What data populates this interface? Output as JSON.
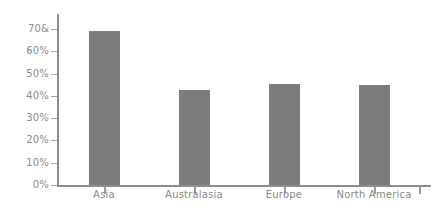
{
  "chart_data": {
    "type": "bar",
    "title": "",
    "subtitle": "",
    "xlabel": "",
    "ylabel": "",
    "categories": [
      "Asia",
      "Australasia",
      "Europe",
      "North America"
    ],
    "values": [
      69,
      42.5,
      45.5,
      45
    ],
    "ylim": [
      0,
      70
    ],
    "y_ticks": [
      0,
      10,
      20,
      30,
      40,
      50,
      60,
      70
    ],
    "y_tick_labels": [
      "0%",
      "10%",
      "20%",
      "30%",
      "40%",
      "50%",
      "60%",
      "70&"
    ],
    "grid": false,
    "legend": false,
    "legend_position": "none",
    "series": [
      {
        "name": "",
        "values": [
          69,
          42.5,
          45.5,
          45
        ]
      }
    ],
    "colors": {
      "bar_fill": "#7c7c7c",
      "axis": "#8d8d8d",
      "tick": "#a6a6a6",
      "text": "#8a8a8a",
      "background": "#ffffff"
    }
  }
}
